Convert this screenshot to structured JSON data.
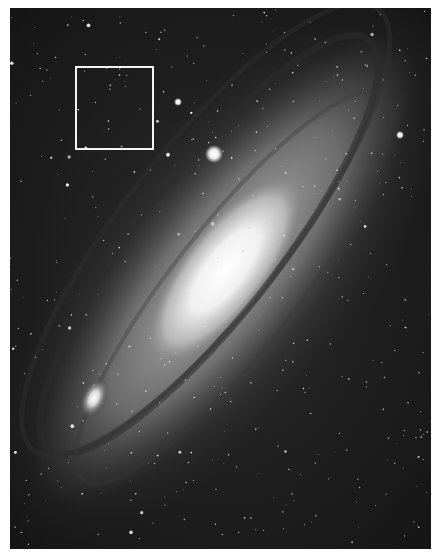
{
  "image": {
    "subject": "Andromeda galaxy (M31) with satellite galaxies",
    "style": "grayscale astrophotograph",
    "background_color": "#ffffff",
    "sky_color": "#1a1a1a",
    "core_color": "#f2f2f2"
  },
  "annotations": [
    {
      "type": "rectangle",
      "color": "#f4f4f4",
      "label": ""
    }
  ]
}
